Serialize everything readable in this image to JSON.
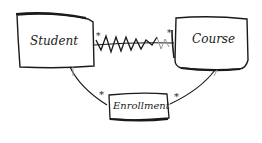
{
  "diagram": {
    "type": "entity-relationship sketch",
    "entities": [
      {
        "id": "student",
        "label": "Student"
      },
      {
        "id": "course",
        "label": "Course"
      },
      {
        "id": "enrollment",
        "label": "Enrollment"
      }
    ],
    "relationships": [
      {
        "from": "student",
        "to": "course",
        "style": "wavy many-to-many",
        "from_mult": "*",
        "to_mult": "*"
      },
      {
        "from": "student",
        "to": "enrollment",
        "to_mult": "*"
      },
      {
        "from": "course",
        "to": "enrollment",
        "to_mult": "*"
      }
    ],
    "colors": {
      "stroke": "#1a1a1a",
      "faint": "#9a9a9a",
      "background": "#ffffff"
    }
  }
}
